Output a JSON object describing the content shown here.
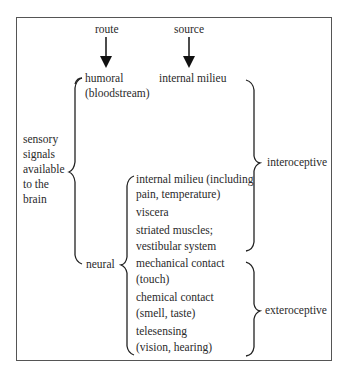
{
  "diagram": {
    "headers": {
      "route": "route",
      "source": "source"
    },
    "humoral": {
      "line1": "humoral",
      "line2": "(bloodstream)"
    },
    "internal_milieu_top": "internal milieu",
    "sensory_signals": [
      "sensory",
      "signals",
      "available",
      "to the",
      "brain"
    ],
    "neural": "neural",
    "neural_items": [
      {
        "line1": "internal milieu (including",
        "line2": "pain, temperature)"
      },
      {
        "line1": "viscera",
        "line2": ""
      },
      {
        "line1": "striated muscles;",
        "line2": "vestibular system"
      },
      {
        "line1": "mechanical contact",
        "line2": "(touch)"
      },
      {
        "line1": "chemical contact",
        "line2": "(smell, taste)"
      },
      {
        "line1": "telesensing",
        "line2": "(vision, hearing)"
      }
    ],
    "categories": {
      "interoceptive": "interoceptive",
      "exteroceptive": "exteroceptive"
    }
  }
}
